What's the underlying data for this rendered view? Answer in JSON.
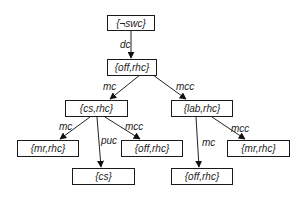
{
  "nodes": {
    "n0": {
      "label": "{¬swc}"
    },
    "n1": {
      "label": "{off,rhc}"
    },
    "n2": {
      "label": "{cs,rhc}"
    },
    "n3": {
      "label": "{lab,rhc}"
    },
    "n4": {
      "label": "{mr,rhc}"
    },
    "n5": {
      "label": "{off,rhc}"
    },
    "n6": {
      "label": "{cs}"
    },
    "n7": {
      "label": "{mr,rhc}"
    },
    "n8": {
      "label": "{off,rhc}"
    }
  },
  "edges": {
    "e0": {
      "from": "{¬swc}",
      "to": "{off,rhc}",
      "label": "dc"
    },
    "e1": {
      "from": "{off,rhc}",
      "to": "{cs,rhc}",
      "label": "mc"
    },
    "e2": {
      "from": "{off,rhc}",
      "to": "{lab,rhc}",
      "label": "mcc"
    },
    "e3": {
      "from": "{cs,rhc}",
      "to": "{mr,rhc}",
      "label": "mc"
    },
    "e4": {
      "from": "{cs,rhc}",
      "to": "{cs}",
      "label": "puc"
    },
    "e5": {
      "from": "{cs,rhc}",
      "to": "{off,rhc}",
      "label": "mcc"
    },
    "e6": {
      "from": "{lab,rhc}",
      "to": "{off,rhc}",
      "label": "mc"
    },
    "e7": {
      "from": "{lab,rhc}",
      "to": "{mr,rhc}",
      "label": "mcc"
    }
  }
}
